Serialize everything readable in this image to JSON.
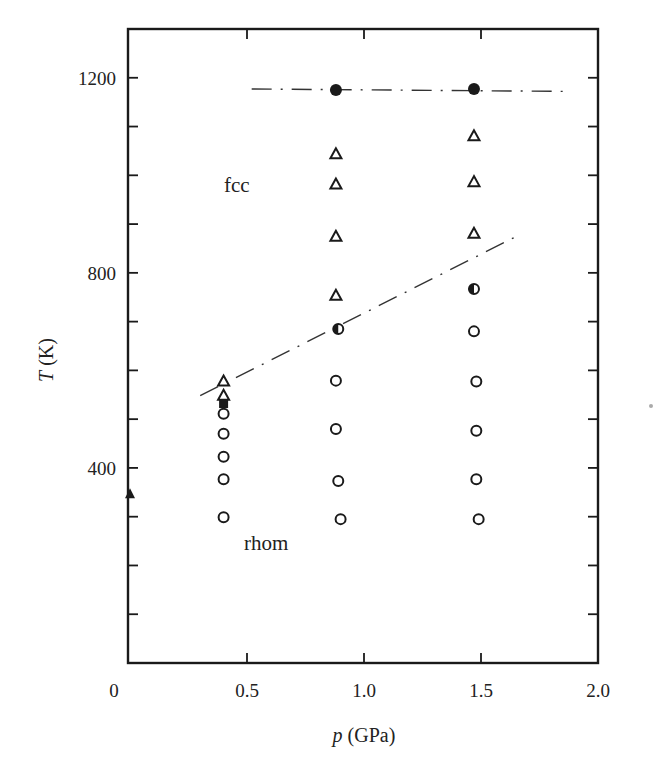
{
  "chart_data": {
    "type": "scatter",
    "title": "",
    "xlabel": "p (GPa)",
    "xlabel_parts": {
      "var": "p",
      "unit": "(GPa)"
    },
    "ylabel": "T (K)",
    "ylabel_parts": {
      "var": "T",
      "unit": "(K)"
    },
    "xlim": [
      0,
      2.0
    ],
    "ylim": [
      0,
      1300
    ],
    "grid": false,
    "legend": null,
    "x_ticks": [
      0.5,
      1.0,
      1.5
    ],
    "x_tick_labels": [
      "0",
      "0.5",
      "1.0",
      "1.5",
      "2.0"
    ],
    "y_ticks": [
      100,
      200,
      300,
      400,
      500,
      600,
      700,
      800,
      900,
      1000,
      1100,
      1200
    ],
    "y_tick_labels": [
      "400",
      "800",
      "1200"
    ],
    "annotations": [
      {
        "text": "fcc",
        "x": 0.48,
        "y": 970
      },
      {
        "text": "rhom",
        "x": 0.64,
        "y": 250
      }
    ],
    "series": [
      {
        "name": "open triangles (fcc)",
        "marker": "open-triangle",
        "points": [
          [
            0.4,
            577
          ],
          [
            0.4,
            548
          ],
          [
            0.88,
            1043
          ],
          [
            0.88,
            981
          ],
          [
            0.88,
            874
          ],
          [
            0.88,
            753
          ],
          [
            1.47,
            1080
          ],
          [
            1.47,
            986
          ],
          [
            1.47,
            880
          ]
        ]
      },
      {
        "name": "open circles (rhom)",
        "marker": "open-circle",
        "points": [
          [
            0.4,
            511
          ],
          [
            0.4,
            470
          ],
          [
            0.4,
            423
          ],
          [
            0.4,
            377
          ],
          [
            0.4,
            299
          ],
          [
            0.88,
            579
          ],
          [
            0.88,
            480
          ],
          [
            0.89,
            373
          ],
          [
            0.9,
            295
          ],
          [
            1.47,
            680
          ],
          [
            1.48,
            577
          ],
          [
            1.48,
            476
          ],
          [
            1.48,
            377
          ],
          [
            1.49,
            295
          ]
        ]
      },
      {
        "name": "half-filled circles (transition)",
        "marker": "half-circle",
        "points": [
          [
            0.89,
            685
          ],
          [
            1.47,
            767
          ]
        ]
      },
      {
        "name": "filled circles (melting)",
        "marker": "filled-circle",
        "points": [
          [
            0.88,
            1175
          ],
          [
            1.47,
            1177
          ]
        ]
      },
      {
        "name": "filled square",
        "marker": "filled-square",
        "points": [
          [
            0.4,
            532
          ]
        ]
      },
      {
        "name": "filled triangle (ambient)",
        "marker": "filled-triangle",
        "points": [
          [
            0.0,
            346
          ]
        ]
      }
    ],
    "lines": [
      {
        "name": "melting line",
        "style": "dash-dot",
        "points": [
          [
            0.52,
            1177
          ],
          [
            1.88,
            1172
          ]
        ]
      },
      {
        "name": "fcc-rhom boundary",
        "style": "dash-dot",
        "points": [
          [
            0.3,
            548
          ],
          [
            1.64,
            872
          ]
        ]
      }
    ]
  }
}
